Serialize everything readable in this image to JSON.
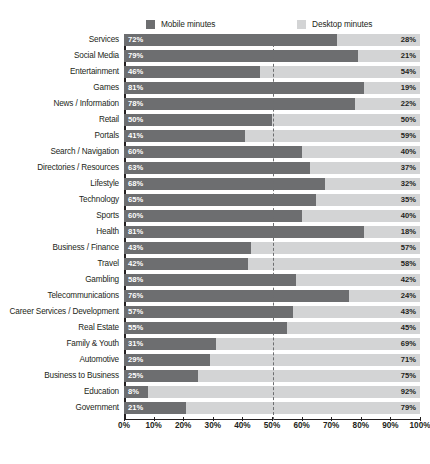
{
  "legend": {
    "mobile": {
      "label": "Mobile minutes",
      "color": "#6d6e70"
    },
    "desktop": {
      "label": "Desktop minutes",
      "color": "#d3d4d5"
    }
  },
  "chart_data": {
    "type": "bar",
    "orientation": "horizontal",
    "stacked": true,
    "title": "",
    "xlabel": "",
    "ylabel": "",
    "xlim": [
      0,
      100
    ],
    "grid": false,
    "legend_position": "top",
    "midline_at": 50,
    "xticks": [
      "0%",
      "10%",
      "20%",
      "30%",
      "40%",
      "50%",
      "60%",
      "70%",
      "80%",
      "90%",
      "100%"
    ],
    "xtick_values": [
      0,
      10,
      20,
      30,
      40,
      50,
      60,
      70,
      80,
      90,
      100
    ],
    "categories": [
      "Services",
      "Social Media",
      "Entertainment",
      "Games",
      "News / Information",
      "Retail",
      "Portals",
      "Search / Navigation",
      "Directories / Resources",
      "Lifestyle",
      "Technology",
      "Sports",
      "Health",
      "Business / Finance",
      "Travel",
      "Gambling",
      "Telecommunications",
      "Career Services / Development",
      "Real Estate",
      "Family & Youth",
      "Automotive",
      "Business to Business",
      "Education",
      "Government"
    ],
    "series": [
      {
        "name": "Mobile minutes",
        "color": "#6d6e70",
        "values": [
          72,
          79,
          46,
          81,
          78,
          50,
          41,
          60,
          63,
          68,
          65,
          60,
          81,
          43,
          42,
          58,
          76,
          57,
          55,
          31,
          29,
          25,
          8,
          21
        ],
        "labels": [
          "72%",
          "79%",
          "46%",
          "81%",
          "78%",
          "50%",
          "41%",
          "60%",
          "63%",
          "68%",
          "65%",
          "60%",
          "81%",
          "43%",
          "42%",
          "58%",
          "76%",
          "57%",
          "55%",
          "31%",
          "29%",
          "25%",
          "8%",
          "21%"
        ]
      },
      {
        "name": "Desktop minutes",
        "color": "#d3d4d5",
        "values": [
          28,
          21,
          54,
          19,
          22,
          50,
          59,
          40,
          37,
          32,
          35,
          40,
          18,
          57,
          58,
          42,
          24,
          43,
          45,
          69,
          71,
          75,
          92,
          79
        ],
        "labels": [
          "28%",
          "21%",
          "54%",
          "19%",
          "22%",
          "50%",
          "59%",
          "40%",
          "37%",
          "32%",
          "35%",
          "40%",
          "18%",
          "57%",
          "58%",
          "42%",
          "24%",
          "43%",
          "45%",
          "69%",
          "71%",
          "75%",
          "92%",
          "79%"
        ]
      }
    ]
  },
  "caption": ""
}
